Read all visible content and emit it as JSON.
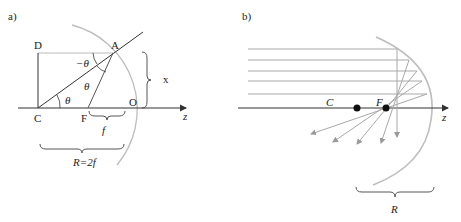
{
  "panel_a": {
    "label": "a)",
    "points": {
      "D": "D",
      "A": "A",
      "C": "C",
      "F": "F",
      "O": "O"
    },
    "angles": {
      "neg_theta": "−θ",
      "theta_upper": "θ",
      "theta_lower": "θ"
    },
    "x_label": "x",
    "f_label": "f",
    "z_label": "z",
    "R_label": "R=2f"
  },
  "panel_b": {
    "label": "b)",
    "C_label": "C",
    "F_label": "F",
    "z_label": "z",
    "R_label": "R",
    "ray_count": 5
  },
  "colors": {
    "mirror": "#bdbdbd",
    "ray": "#a8a8a8",
    "ink": "#333333"
  }
}
